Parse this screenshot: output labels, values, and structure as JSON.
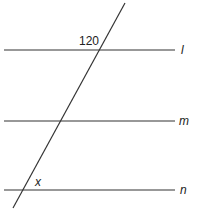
{
  "diagram": {
    "type": "parallel-lines-transversal",
    "lines": [
      {
        "id": "l",
        "label": "l",
        "y": 50
      },
      {
        "id": "m",
        "label": "m",
        "y": 121
      },
      {
        "id": "n",
        "label": "n",
        "y": 190
      }
    ],
    "transversal": {
      "x1": 125,
      "y1": 3,
      "x2": 13,
      "y2": 208
    },
    "angle_labels": {
      "top": "120",
      "bottom": "x"
    },
    "colors": {
      "stroke": "#333333",
      "text": "#222222"
    }
  }
}
